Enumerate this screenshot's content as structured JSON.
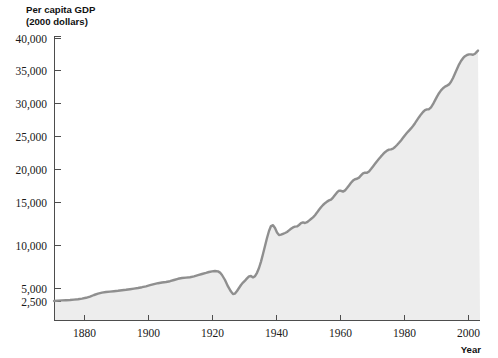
{
  "figure": {
    "background_color": "#ffffff",
    "width": 498,
    "height": 358
  },
  "labels": {
    "y_axis_title_line1": "Per capita GDP",
    "y_axis_title_line2": "(2000 dollars)",
    "x_axis_title": "Year"
  },
  "chart_data": {
    "type": "area",
    "title": "",
    "subtitle": "",
    "xlabel": "Year",
    "ylabel": "Per capita GDP (2000 dollars)",
    "line_color": "#8f8f8f",
    "fill_color": "#ededed",
    "grid": false,
    "legend": "none",
    "xlim": [
      1872,
      2002
    ],
    "ylim": [
      2500,
      40000
    ],
    "xticks": [
      1880,
      1900,
      1920,
      1940,
      1960,
      1980,
      2000
    ],
    "xtick_labels": [
      "1880",
      "1900",
      "1920",
      "1940",
      "1960",
      "1980",
      "2000"
    ],
    "yticks": [
      2500,
      5000,
      10000,
      15000,
      20000,
      25000,
      30000,
      35000,
      40000
    ],
    "ytick_labels": [
      "2,500",
      "5,000",
      "10,000",
      "15,000",
      "20,000",
      "25,000",
      "30,000",
      "35,000",
      "40,000"
    ],
    "y_scale_note": "linear above 5,000; compressed segment between 2,500 and 5,000",
    "series": [
      {
        "name": "Per capita GDP",
        "x": [
          1872,
          1874,
          1876,
          1878,
          1880,
          1882,
          1884,
          1886,
          1888,
          1890,
          1892,
          1894,
          1896,
          1898,
          1900,
          1902,
          1904,
          1906,
          1908,
          1910,
          1912,
          1914,
          1916,
          1918,
          1920,
          1922,
          1924,
          1926,
          1928,
          1929,
          1930,
          1931,
          1932,
          1933,
          1934,
          1935,
          1936,
          1937,
          1938,
          1939,
          1940,
          1941,
          1942,
          1943,
          1944,
          1945,
          1946,
          1947,
          1948,
          1949,
          1950,
          1951,
          1952,
          1953,
          1954,
          1955,
          1956,
          1957,
          1958,
          1959,
          1960,
          1961,
          1962,
          1963,
          1964,
          1965,
          1966,
          1967,
          1968,
          1969,
          1970,
          1971,
          1972,
          1973,
          1974,
          1975,
          1976,
          1977,
          1978,
          1979,
          1980,
          1981,
          1982,
          1983,
          1984,
          1985,
          1986,
          1987,
          1988,
          1989,
          1990,
          1991,
          1992,
          1993,
          1994,
          1995,
          1996,
          1997,
          1998,
          1999,
          2000,
          2001,
          2002
        ],
        "values": [
          2700,
          2720,
          2760,
          2800,
          2850,
          3050,
          3100,
          3150,
          3200,
          3350,
          3550,
          3300,
          3450,
          3650,
          3850,
          4050,
          4000,
          4350,
          4000,
          4350,
          4500,
          4300,
          4800,
          5100,
          4900,
          5100,
          5500,
          5900,
          5900,
          6200,
          5600,
          5150,
          4450,
          4350,
          4800,
          5150,
          5800,
          6000,
          5650,
          6050,
          6450,
          7500,
          8700,
          10100,
          10800,
          10300,
          8950,
          8650,
          8850,
          8650,
          9300,
          9800,
          9950,
          10250,
          9950,
          10500,
          10500,
          10550,
          10300,
          10850,
          10950,
          11000,
          11500,
          11800,
          12300,
          12900,
          13600,
          13800,
          14300,
          14550,
          14400,
          14700,
          15300,
          16000,
          15700,
          15400,
          16100,
          16700,
          17400,
          17700,
          17400,
          17700,
          17100,
          17700,
          18800,
          19300,
          19800,
          20300,
          20900,
          21400,
          21500,
          21100,
          21600,
          21900,
          22600,
          22900,
          23600,
          24400,
          25200,
          26100,
          26900,
          26900,
          27200
        ],
        "display_note": "Curve drawn on compressed axis as plotted path"
      }
    ],
    "annotations": [
      {
        "label": "Great Depression trough",
        "x": 1933,
        "y": 4350
      },
      {
        "label": "World War II peak",
        "x": 1944,
        "y": 10800
      },
      {
        "label": "End of series",
        "x": 2002,
        "y": 27200
      }
    ]
  },
  "plot_geometry": {
    "left": 54,
    "right": 480,
    "top": 36,
    "bottom": 320,
    "x_tick_pixels": [
      84,
      148,
      212,
      276,
      340,
      404,
      468
    ],
    "y_tick_pixels": [
      301,
      288,
      245,
      202,
      169,
      136,
      103,
      70,
      38
    ],
    "path_line": "M54,301 L58,300.6 L62,300.4 L66,300.2 L70,300 L74,299.6 L78,299.2 L82,298.6 L86,297.8 L90,296.6 L94,295 L98,293.6 L102,292.6 L106,292 L110,291.6 L114,291.2 L118,290.8 L122,290.3 L126,289.8 L130,289.2 L134,288.6 L138,288 L142,287.2 L146,286.3 L150,285.2 L154,284.1 L158,283.2 L162,282.5 L166,282 L170,281.2 L174,280 L178,278.8 L182,278 L186,277.6 L190,277.2 L194,276.4 L198,275.2 L202,274 L206,272.9 L209,272 L212,271.4 L215,271 L218,271.4 L220,272.6 L222,275 L225,280 L228,286.4 L231,291.6 L233,294 L235,293.6 L237,291 L239,288 L241,285 L243,282.6 L245,280.6 L247,278.4 L249,276.4 L251,276 L253,277.4 L255,276.2 L257,272.8 L259,268 L261,261.6 L263,254 L265,246 L267,238 L269,231 L271,226 L273,225.2 L275,228 L277,232.6 L279,235 L281,234.6 L283,233.8 L285,233 L287,232 L289,230.4 L291,228.8 L293,227.4 L295,226.6 L297,226.4 L299,225 L301,223.2 L303,222.4 L305,223 L307,222.2 L309,220.6 L311,219 L313,217.4 L315,215.2 L317,212.6 L319,209.8 L321,207.2 L323,205 L325,203.2 L327,201.6 L329,200.4 L331,199.6 L333,197.6 L335,195 L337,192.4 L339,190.6 L341,190.8 L343,191.6 L345,190.4 L347,188 L349,185.4 L351,182.8 L353,180.6 L355,179.2 L357,178.8 L359,177.6 L361,175.4 L363,173.4 L365,172.6 L367,172.8 L369,171.4 L371,169 L373,166.4 L375,163.8 L377,161.2 L379,158.8 L381,156.4 L383,154.2 L385,152.2 L387,150.6 L389,149.6 L391,149.4 L393,148.6 L395,147 L397,145 L399,142.8 L401,140.4 L403,137.8 L405,135.2 L407,132.8 L409,130.6 L411,128.4 L413,126 L415,123.2 L417,120.2 L419,117.2 L421,114.4 L423,112 L425,110.2 L427,109.4 L429,109.2 L431,107.4 L433,104.2 L435,100.4 L437,96.6 L439,93.2 L441,90.4 L443,88.2 L445,86.6 L447,85.6 L449,84.4 L451,81.8 L453,78 L455,73.6 L457,69 L459,64.6 L461,61 L463,58.2 L465,56.2 L467,55 L469,54.4 L471,54.4 L473,54.8 L475,53.8 L477,51.6 L478,50.6"
  }
}
